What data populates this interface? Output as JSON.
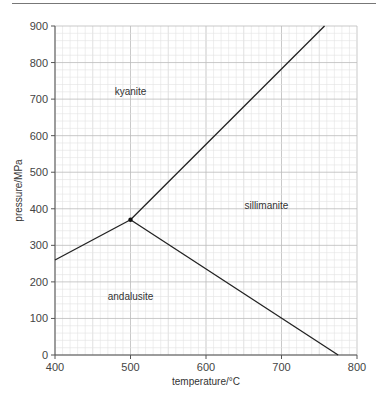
{
  "chart_data": {
    "type": "line",
    "title": "",
    "xlabel": "temperature/°C",
    "ylabel": "pressure/MPa",
    "xlim": [
      400,
      800
    ],
    "ylim": [
      0,
      900
    ],
    "xticks": [
      "400",
      "500",
      "600",
      "700",
      "800"
    ],
    "yticks": [
      "0",
      "100",
      "200",
      "300",
      "400",
      "500",
      "600",
      "700",
      "800",
      "900"
    ],
    "grid": true,
    "series": [
      {
        "name": "kyanite-andalusite boundary",
        "points": [
          [
            400,
            260
          ],
          [
            500,
            370
          ]
        ]
      },
      {
        "name": "kyanite-sillimanite boundary",
        "points": [
          [
            500,
            370
          ],
          [
            757,
            900
          ]
        ]
      },
      {
        "name": "andalusite-sillimanite boundary",
        "points": [
          [
            500,
            370
          ],
          [
            775,
            0
          ]
        ]
      }
    ],
    "triple_point": {
      "x": 500,
      "y": 370
    },
    "annotations": [
      {
        "text": "kyanite",
        "x": 500,
        "y": 710
      },
      {
        "text": "sillimanite",
        "x": 680,
        "y": 400
      },
      {
        "text": "andalusite",
        "x": 500,
        "y": 150
      }
    ]
  }
}
